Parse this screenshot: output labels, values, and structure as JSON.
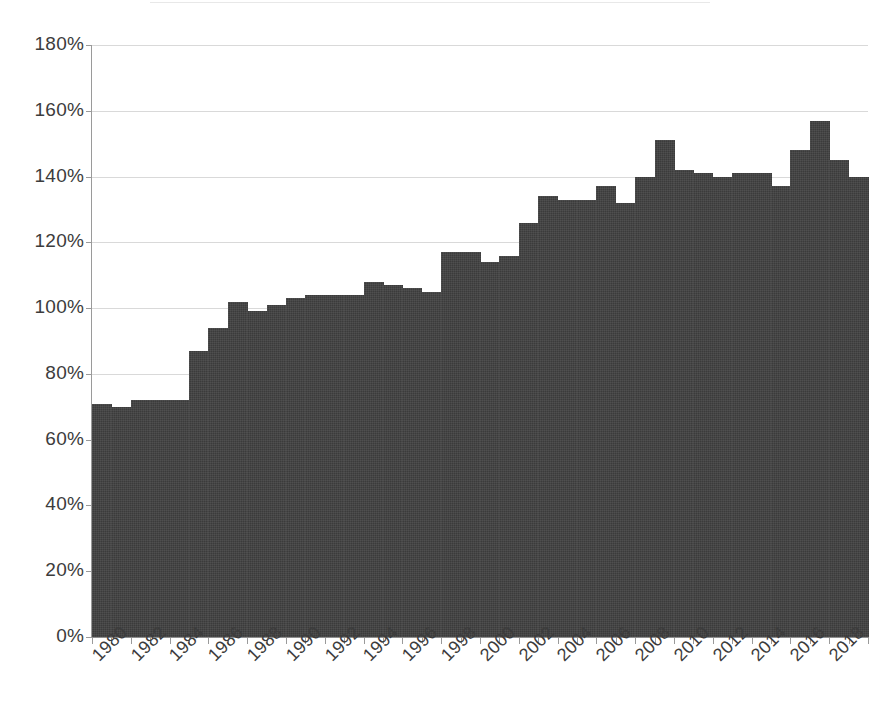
{
  "chart_data": {
    "type": "bar",
    "title": "",
    "subtitle": "",
    "xlabel": "",
    "ylabel": "",
    "grid": true,
    "legend": false,
    "legend_position": "none",
    "bar_color": "#3b3b3b",
    "value_format": "percent",
    "ylim": [
      0,
      180
    ],
    "ytick_values": [
      0,
      20,
      40,
      60,
      80,
      100,
      120,
      140,
      160,
      180
    ],
    "ytick_labels": [
      "0%",
      "20%",
      "40%",
      "60%",
      "80%",
      "100%",
      "120%",
      "140%",
      "160%",
      "180%"
    ],
    "xtick_labels": [
      "1980",
      "1982",
      "1984",
      "1986",
      "1988",
      "1990",
      "1992",
      "1994",
      "1996",
      "1998",
      "2000",
      "2002",
      "2004",
      "2006",
      "2008",
      "2010",
      "2012",
      "2014",
      "2016",
      "2018"
    ],
    "categories": [
      "1980",
      "1981",
      "1982",
      "1983",
      "1984",
      "1985",
      "1986",
      "1987",
      "1988",
      "1989",
      "1990",
      "1991",
      "1992",
      "1993",
      "1994",
      "1995",
      "1996",
      "1997",
      "1998",
      "1999",
      "2000",
      "2001",
      "2002",
      "2003",
      "2004",
      "2005",
      "2006",
      "2007",
      "2008",
      "2009",
      "2010",
      "2011",
      "2012",
      "2013",
      "2014",
      "2015",
      "2016",
      "2017",
      "2018",
      "2019"
    ],
    "values": [
      71,
      70,
      72,
      72,
      72,
      87,
      94,
      102,
      99,
      101,
      103,
      104,
      104,
      104,
      108,
      107,
      106,
      105,
      117,
      117,
      114,
      116,
      126,
      134,
      133,
      133,
      137,
      132,
      140,
      151,
      142,
      141,
      140,
      141,
      141,
      137,
      148,
      157,
      145,
      140
    ],
    "x_start": 1980,
    "x_end": 2019
  },
  "axis": {
    "y_min_label": "0%",
    "y_max_label": "180%"
  }
}
